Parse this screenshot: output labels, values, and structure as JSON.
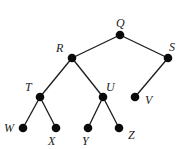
{
  "diagram": {
    "type": "binary-tree",
    "root": "Q",
    "nodes": [
      {
        "id": "Q",
        "label": "Q",
        "x": 120,
        "y": 35,
        "lx": 116,
        "ly": 27
      },
      {
        "id": "R",
        "label": "R",
        "x": 72,
        "y": 58,
        "lx": 56,
        "ly": 52
      },
      {
        "id": "S",
        "label": "S",
        "x": 168,
        "y": 58,
        "lx": 169,
        "ly": 51
      },
      {
        "id": "T",
        "label": "T",
        "x": 40,
        "y": 97,
        "lx": 25,
        "ly": 91
      },
      {
        "id": "U",
        "label": "U",
        "x": 103,
        "y": 97,
        "lx": 106,
        "ly": 91
      },
      {
        "id": "V",
        "label": "V",
        "x": 135,
        "y": 97,
        "lx": 145,
        "ly": 104
      },
      {
        "id": "W",
        "label": "W",
        "x": 23,
        "y": 128,
        "lx": 4,
        "ly": 132
      },
      {
        "id": "X",
        "label": "X",
        "x": 56,
        "y": 128,
        "lx": 48,
        "ly": 145
      },
      {
        "id": "Y",
        "label": "Y",
        "x": 88,
        "y": 128,
        "lx": 82,
        "ly": 145
      },
      {
        "id": "Z",
        "label": "Z",
        "x": 119,
        "y": 128,
        "lx": 128,
        "ly": 139
      }
    ],
    "edges": [
      {
        "from": "Q",
        "to": "R"
      },
      {
        "from": "Q",
        "to": "S"
      },
      {
        "from": "R",
        "to": "T"
      },
      {
        "from": "R",
        "to": "U"
      },
      {
        "from": "S",
        "to": "V"
      },
      {
        "from": "T",
        "to": "W"
      },
      {
        "from": "T",
        "to": "X"
      },
      {
        "from": "U",
        "to": "Y"
      },
      {
        "from": "U",
        "to": "Z"
      }
    ]
  }
}
